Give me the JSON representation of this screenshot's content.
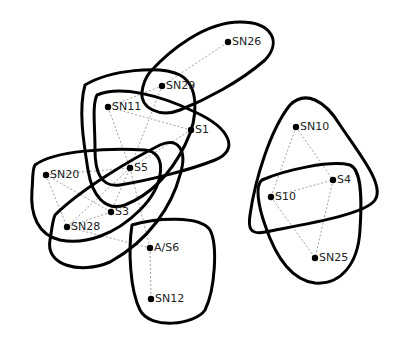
{
  "diagram": {
    "type": "hypergraph",
    "nodes": [
      {
        "id": "SN26",
        "label": "SN26",
        "x": 228,
        "y": 42
      },
      {
        "id": "SN29",
        "label": "SN29",
        "x": 162,
        "y": 86
      },
      {
        "id": "SN11",
        "label": "SN11",
        "x": 108,
        "y": 107
      },
      {
        "id": "S1",
        "label": "S1",
        "x": 191,
        "y": 130
      },
      {
        "id": "S5",
        "label": "S5",
        "x": 130,
        "y": 168
      },
      {
        "id": "SN20",
        "label": "SN20",
        "x": 46,
        "y": 175
      },
      {
        "id": "S3",
        "label": "S3",
        "x": 111,
        "y": 212
      },
      {
        "id": "SN28",
        "label": "SN28",
        "x": 67,
        "y": 227
      },
      {
        "id": "AS6",
        "label": "A/S6",
        "x": 150,
        "y": 248
      },
      {
        "id": "SN12",
        "label": "SN12",
        "x": 151,
        "y": 299
      },
      {
        "id": "SN10",
        "label": "SN10",
        "x": 296,
        "y": 127
      },
      {
        "id": "S4",
        "label": "S4",
        "x": 333,
        "y": 180
      },
      {
        "id": "S10",
        "label": "S10",
        "x": 271,
        "y": 197
      },
      {
        "id": "SN25",
        "label": "SN25",
        "x": 315,
        "y": 258
      }
    ],
    "edges": [
      [
        "SN29",
        "SN26"
      ],
      [
        "SN11",
        "SN29"
      ],
      [
        "SN11",
        "S1"
      ],
      [
        "SN11",
        "S5"
      ],
      [
        "SN29",
        "S5"
      ],
      [
        "S1",
        "S5"
      ],
      [
        "SN20",
        "S5"
      ],
      [
        "SN20",
        "S3"
      ],
      [
        "SN20",
        "SN28"
      ],
      [
        "SN28",
        "S5"
      ],
      [
        "S3",
        "S5"
      ],
      [
        "SN28",
        "S3"
      ],
      [
        "SN28",
        "AS6"
      ],
      [
        "S5",
        "AS6"
      ],
      [
        "AS6",
        "SN12"
      ],
      [
        "SN10",
        "S4"
      ],
      [
        "SN10",
        "S10"
      ],
      [
        "S10",
        "S4"
      ],
      [
        "S10",
        "SN25"
      ],
      [
        "S4",
        "SN25"
      ]
    ],
    "hyperedges": [
      {
        "name": "SN26-SN29",
        "members": [
          "SN26",
          "SN29"
        ]
      },
      {
        "name": "SN29-SN11-S1-S5",
        "members": [
          "SN29",
          "SN11",
          "S1",
          "S5"
        ]
      },
      {
        "name": "SN11-S5-S1",
        "members": [
          "SN11",
          "S1",
          "S5"
        ]
      },
      {
        "name": "SN20-S5-S3-SN28",
        "members": [
          "SN20",
          "S5",
          "S3",
          "SN28"
        ]
      },
      {
        "name": "SN28-S3-S1",
        "members": [
          "SN28",
          "S3",
          "S5"
        ]
      },
      {
        "name": "AS6-SN12",
        "members": [
          "AS6",
          "SN12"
        ]
      },
      {
        "name": "SN10-S10-S4",
        "members": [
          "SN10",
          "S10",
          "S4"
        ]
      },
      {
        "name": "S10-S4-SN25",
        "members": [
          "S10",
          "S4",
          "SN25"
        ]
      }
    ]
  }
}
